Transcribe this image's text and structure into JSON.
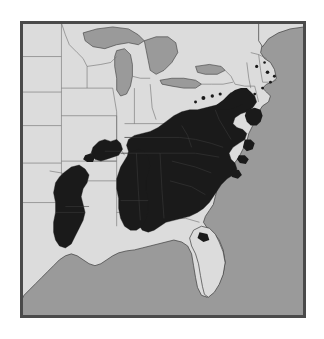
{
  "figure": {
    "kind": "species-distribution-map",
    "title": "",
    "caption": "",
    "region_described": "Eastern United States",
    "alt_text": "Shaded distribution map of the eastern United States showing a dark range covering the Appalachian and Southeastern states, with separate patches in east Texas / Louisiana and the Ozarks, and small isolated dots in the Mid-Atlantic and New England."
  },
  "colors": {
    "page_background": "#ffffff",
    "frame_border": "#4a4a4a",
    "water": "#9a9a9a",
    "land_unshaded": "#dcdcdc",
    "range_shaded": "#1a1a1a",
    "state_boundary": "#6e6e6e",
    "coastline": "#3a3a3a"
  },
  "legend": {
    "present": false,
    "entries": [
      {
        "label": "Range",
        "swatch": "#1a1a1a"
      },
      {
        "label": "Land outside range",
        "swatch": "#dcdcdc"
      },
      {
        "label": "Water",
        "swatch": "#9a9a9a"
      }
    ]
  },
  "geography": {
    "water_bodies": [
      "Atlantic Ocean",
      "Gulf of Mexico",
      "Lake Superior",
      "Lake Michigan",
      "Lake Huron",
      "Lake Erie",
      "Lake Ontario"
    ],
    "shaded_areas": [
      "Appalachian / Southeast main block",
      "East Texas and Louisiana patch",
      "Ozark patch",
      "Mid-Atlantic outliers",
      "New England coastal outliers"
    ]
  },
  "annotations": {
    "labels": [],
    "scale_bar": "",
    "north_arrow": ""
  }
}
